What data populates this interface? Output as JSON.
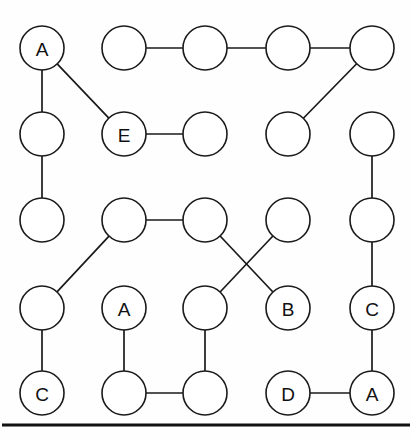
{
  "figure": {
    "background_color": "#fefefe",
    "node_fill_color": "#ffffff",
    "node_stroke_color": "#1a1a1a",
    "edge_color": "#1a1a1a",
    "label_color": "#111111",
    "node_radius": 22,
    "columns_x": [
      42,
      124,
      205,
      288,
      372
    ],
    "rows_y": [
      48,
      134,
      220,
      308,
      393
    ],
    "bottom_rule": {
      "name": "bottom-rule",
      "y": 425,
      "x1": 2,
      "x2": 410,
      "color": "#111111",
      "thickness": 3.2
    }
  },
  "nodes": [
    {
      "id": "r1c1",
      "row": 0,
      "col": 0,
      "cx": 42,
      "cy": 48,
      "label": "A"
    },
    {
      "id": "r1c2",
      "row": 0,
      "col": 1,
      "cx": 124,
      "cy": 48,
      "label": ""
    },
    {
      "id": "r1c3",
      "row": 0,
      "col": 2,
      "cx": 205,
      "cy": 48,
      "label": ""
    },
    {
      "id": "r1c4",
      "row": 0,
      "col": 3,
      "cx": 288,
      "cy": 48,
      "label": ""
    },
    {
      "id": "r1c5",
      "row": 0,
      "col": 4,
      "cx": 372,
      "cy": 48,
      "label": ""
    },
    {
      "id": "r2c1",
      "row": 1,
      "col": 0,
      "cx": 42,
      "cy": 134,
      "label": ""
    },
    {
      "id": "r2c2",
      "row": 1,
      "col": 1,
      "cx": 124,
      "cy": 134,
      "label": "E"
    },
    {
      "id": "r2c3",
      "row": 1,
      "col": 2,
      "cx": 205,
      "cy": 134,
      "label": ""
    },
    {
      "id": "r2c4",
      "row": 1,
      "col": 3,
      "cx": 288,
      "cy": 134,
      "label": ""
    },
    {
      "id": "r2c5",
      "row": 1,
      "col": 4,
      "cx": 372,
      "cy": 134,
      "label": ""
    },
    {
      "id": "r3c1",
      "row": 2,
      "col": 0,
      "cx": 42,
      "cy": 220,
      "label": ""
    },
    {
      "id": "r3c2",
      "row": 2,
      "col": 1,
      "cx": 124,
      "cy": 220,
      "label": ""
    },
    {
      "id": "r3c3",
      "row": 2,
      "col": 2,
      "cx": 205,
      "cy": 220,
      "label": ""
    },
    {
      "id": "r3c4",
      "row": 2,
      "col": 3,
      "cx": 288,
      "cy": 220,
      "label": ""
    },
    {
      "id": "r3c5",
      "row": 2,
      "col": 4,
      "cx": 372,
      "cy": 220,
      "label": ""
    },
    {
      "id": "r4c1",
      "row": 3,
      "col": 0,
      "cx": 42,
      "cy": 308,
      "label": ""
    },
    {
      "id": "r4c2",
      "row": 3,
      "col": 1,
      "cx": 124,
      "cy": 308,
      "label": "A"
    },
    {
      "id": "r4c3",
      "row": 3,
      "col": 2,
      "cx": 205,
      "cy": 308,
      "label": ""
    },
    {
      "id": "r4c4",
      "row": 3,
      "col": 3,
      "cx": 288,
      "cy": 308,
      "label": "B"
    },
    {
      "id": "r4c5",
      "row": 3,
      "col": 4,
      "cx": 372,
      "cy": 308,
      "label": "C"
    },
    {
      "id": "r5c1",
      "row": 4,
      "col": 0,
      "cx": 42,
      "cy": 393,
      "label": "C"
    },
    {
      "id": "r5c2",
      "row": 4,
      "col": 1,
      "cx": 124,
      "cy": 393,
      "label": ""
    },
    {
      "id": "r5c3",
      "row": 4,
      "col": 2,
      "cx": 205,
      "cy": 393,
      "label": ""
    },
    {
      "id": "r5c4",
      "row": 4,
      "col": 3,
      "cx": 288,
      "cy": 393,
      "label": "D"
    },
    {
      "id": "r5c5",
      "row": 4,
      "col": 4,
      "cx": 372,
      "cy": 393,
      "label": "A"
    }
  ],
  "edges": [
    {
      "from": "r1c1",
      "to": "r2c1",
      "kind": "vertical"
    },
    {
      "from": "r1c1",
      "to": "r2c2",
      "kind": "diagonal"
    },
    {
      "from": "r1c2",
      "to": "r1c3",
      "kind": "horizontal"
    },
    {
      "from": "r1c3",
      "to": "r1c4",
      "kind": "horizontal"
    },
    {
      "from": "r1c4",
      "to": "r1c5",
      "kind": "horizontal"
    },
    {
      "from": "r1c5",
      "to": "r2c4",
      "kind": "diagonal"
    },
    {
      "from": "r2c1",
      "to": "r3c1",
      "kind": "vertical"
    },
    {
      "from": "r2c2",
      "to": "r2c3",
      "kind": "horizontal"
    },
    {
      "from": "r2c5",
      "to": "r3c5",
      "kind": "vertical"
    },
    {
      "from": "r3c2",
      "to": "r3c3",
      "kind": "horizontal"
    },
    {
      "from": "r3c2",
      "to": "r4c1",
      "kind": "diagonal"
    },
    {
      "from": "r3c3",
      "to": "r4c4",
      "kind": "diagonal"
    },
    {
      "from": "r3c4",
      "to": "r4c3",
      "kind": "diagonal"
    },
    {
      "from": "r3c5",
      "to": "r4c5",
      "kind": "vertical"
    },
    {
      "from": "r4c1",
      "to": "r5c1",
      "kind": "vertical"
    },
    {
      "from": "r4c2",
      "to": "r5c2",
      "kind": "vertical"
    },
    {
      "from": "r4c3",
      "to": "r5c3",
      "kind": "vertical"
    },
    {
      "from": "r4c5",
      "to": "r5c5",
      "kind": "vertical"
    },
    {
      "from": "r5c2",
      "to": "r5c3",
      "kind": "horizontal"
    },
    {
      "from": "r5c4",
      "to": "r5c5",
      "kind": "horizontal"
    }
  ],
  "legend": {
    "labels_present": [
      "A",
      "E",
      "A",
      "B",
      "C",
      "C",
      "D",
      "A"
    ],
    "labeled_node_count": 8,
    "total_node_count": 25,
    "edge_count": 20
  }
}
